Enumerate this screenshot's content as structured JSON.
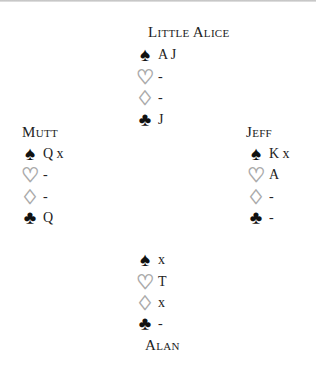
{
  "diagram": {
    "suits": {
      "spades": {
        "icon": "spade-icon",
        "glyph": "♠"
      },
      "hearts": {
        "icon": "heart-icon",
        "glyph": "♡"
      },
      "diamonds": {
        "icon": "diamond-icon",
        "glyph": "♢"
      },
      "clubs": {
        "icon": "club-icon",
        "glyph": "♣"
      }
    },
    "north": {
      "name": "Little Alice",
      "spades": "A J",
      "hearts": "-",
      "diamonds": "-",
      "clubs": "J"
    },
    "west": {
      "name": "Mutt",
      "spades": "Q x",
      "hearts": "-",
      "diamonds": "-",
      "clubs": "Q"
    },
    "east": {
      "name": "Jeff",
      "spades": "K x",
      "hearts": "A",
      "diamonds": "-",
      "clubs": "-"
    },
    "south": {
      "name": "Alan",
      "spades": "x",
      "hearts": "T",
      "diamonds": "x",
      "clubs": "-"
    }
  }
}
